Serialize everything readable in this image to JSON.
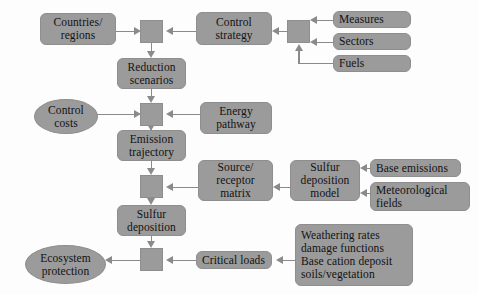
{
  "diagram": {
    "colors": {
      "node_fill": "#9b9b9b",
      "node_border": "#8e8e8e",
      "edge": "#8a8a8a",
      "background": "#fdfdfd",
      "text": "#121212"
    },
    "nodes": [
      {
        "id": "countries_regions",
        "label": "Countries/\nregions",
        "shape": "rounded",
        "x": 40,
        "y": 13,
        "w": 76,
        "h": 32
      },
      {
        "id": "junction_1",
        "label": "",
        "shape": "junction",
        "x": 140,
        "y": 20,
        "w": 23,
        "h": 23
      },
      {
        "id": "control_strategy",
        "label": "Control\nstrategy",
        "shape": "rounded",
        "x": 196,
        "y": 12,
        "w": 76,
        "h": 33
      },
      {
        "id": "junction_2",
        "label": "",
        "shape": "junction",
        "x": 287,
        "y": 20,
        "w": 23,
        "h": 23
      },
      {
        "id": "measures",
        "label": "Measures",
        "shape": "rounded",
        "x": 333,
        "y": 11,
        "w": 78,
        "h": 17
      },
      {
        "id": "sectors",
        "label": "Sectors",
        "shape": "rounded",
        "x": 333,
        "y": 33,
        "w": 78,
        "h": 17
      },
      {
        "id": "fuels",
        "label": "Fuels",
        "shape": "rounded",
        "x": 333,
        "y": 55,
        "w": 78,
        "h": 17
      },
      {
        "id": "reduction_scenarios",
        "label": "Reduction\nscenarios",
        "shape": "rounded",
        "x": 117,
        "y": 58,
        "w": 69,
        "h": 31
      },
      {
        "id": "control_costs",
        "label": "Control\ncosts",
        "shape": "ellipse",
        "x": 34,
        "y": 99,
        "w": 64,
        "h": 35
      },
      {
        "id": "junction_3",
        "label": "",
        "shape": "junction",
        "x": 140,
        "y": 103,
        "w": 23,
        "h": 23
      },
      {
        "id": "energy_pathway",
        "label": "Energy\npathway",
        "shape": "rounded",
        "x": 200,
        "y": 102,
        "w": 72,
        "h": 32
      },
      {
        "id": "emission_trajectory",
        "label": "Emission\ntrajectory",
        "shape": "rounded",
        "x": 117,
        "y": 130,
        "w": 69,
        "h": 31
      },
      {
        "id": "junction_4",
        "label": "",
        "shape": "junction",
        "x": 140,
        "y": 175,
        "w": 23,
        "h": 23
      },
      {
        "id": "source_receptor",
        "label": "Source/\nreceptor\nmatrix",
        "shape": "rounded",
        "x": 198,
        "y": 160,
        "w": 75,
        "h": 41
      },
      {
        "id": "sulfur_dep_model",
        "label": "Sulfur\ndeposition\nmodel",
        "shape": "rounded",
        "x": 290,
        "y": 160,
        "w": 70,
        "h": 41
      },
      {
        "id": "base_emissions",
        "label": "Base emissions",
        "shape": "rounded",
        "x": 370,
        "y": 159,
        "w": 91,
        "h": 18
      },
      {
        "id": "meteorological",
        "label": "Meteorological\nfields",
        "shape": "rounded",
        "x": 370,
        "y": 182,
        "w": 100,
        "h": 29,
        "align": "left"
      },
      {
        "id": "sulfur_deposition",
        "label": "Sulfur\ndeposition",
        "shape": "rounded",
        "x": 117,
        "y": 205,
        "w": 69,
        "h": 31
      },
      {
        "id": "junction_5",
        "label": "",
        "shape": "junction",
        "x": 140,
        "y": 248,
        "w": 23,
        "h": 23
      },
      {
        "id": "critical_loads",
        "label": "Critical loads",
        "shape": "rounded",
        "x": 196,
        "y": 251,
        "w": 76,
        "h": 18
      },
      {
        "id": "weathering_block",
        "label": "Weathering rates\ndamage functions\nBase cation deposit\nsoils/vegetation",
        "shape": "rounded",
        "x": 295,
        "y": 224,
        "w": 118,
        "h": 62,
        "align": "left"
      },
      {
        "id": "ecosystem_protection",
        "label": "Ecosystem\nprotection",
        "shape": "ellipse",
        "x": 25,
        "y": 245,
        "w": 81,
        "h": 39
      }
    ],
    "edges": [
      {
        "id": "edge-countries-to-junction1",
        "from": "countries_regions",
        "to": "junction_1"
      },
      {
        "id": "edge-control-strategy-to-junction1",
        "from": "control_strategy",
        "to": "junction_1"
      },
      {
        "id": "edge-junction2-to-control-strategy",
        "from": "junction_2",
        "to": "control_strategy"
      },
      {
        "id": "edge-measures-to-junction2",
        "from": "measures",
        "to": "junction_2"
      },
      {
        "id": "edge-sectors-to-junction2",
        "from": "sectors",
        "to": "junction_2"
      },
      {
        "id": "edge-fuels-to-junction2",
        "from": "fuels",
        "to": "junction_2"
      },
      {
        "id": "edge-junction1-to-reduction",
        "from": "junction_1",
        "to": "reduction_scenarios"
      },
      {
        "id": "edge-reduction-to-junction3",
        "from": "reduction_scenarios",
        "to": "junction_3"
      },
      {
        "id": "edge-control-costs-to-junction3",
        "from": "control_costs",
        "to": "junction_3"
      },
      {
        "id": "edge-energy-pathway-to-junction3",
        "from": "energy_pathway",
        "to": "junction_3"
      },
      {
        "id": "edge-junction3-to-emission",
        "from": "junction_3",
        "to": "emission_trajectory"
      },
      {
        "id": "edge-emission-to-junction4",
        "from": "emission_trajectory",
        "to": "junction_4"
      },
      {
        "id": "edge-source-receptor-to-junction4",
        "from": "source_receptor",
        "to": "junction_4"
      },
      {
        "id": "edge-sulfur-model-to-source-receptor",
        "from": "sulfur_dep_model",
        "to": "source_receptor"
      },
      {
        "id": "edge-base-emissions-to-model",
        "from": "base_emissions",
        "to": "sulfur_dep_model"
      },
      {
        "id": "edge-meteorological-to-model",
        "from": "meteorological",
        "to": "sulfur_dep_model"
      },
      {
        "id": "edge-junction4-to-sulfur-dep",
        "from": "junction_4",
        "to": "sulfur_deposition"
      },
      {
        "id": "edge-sulfur-dep-to-junction5",
        "from": "sulfur_deposition",
        "to": "junction_5"
      },
      {
        "id": "edge-critical-loads-to-junction5",
        "from": "critical_loads",
        "to": "junction_5"
      },
      {
        "id": "edge-weathering-to-critical-loads",
        "from": "weathering_block",
        "to": "critical_loads"
      },
      {
        "id": "edge-junction5-to-ecosystem",
        "from": "junction_5",
        "to": "ecosystem_protection"
      }
    ]
  }
}
